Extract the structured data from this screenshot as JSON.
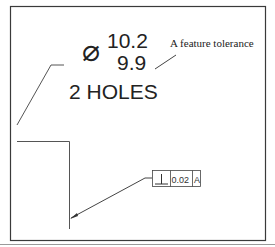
{
  "drawing": {
    "diameter_symbol": "⌀",
    "upper_limit": "10.2",
    "lower_limit": "9.9",
    "hole_count_label": "2 HOLES",
    "annotation": "A feature tolerance",
    "feature_control_frame": {
      "symbol": "⊥",
      "symbol_name": "perpendicularity",
      "tolerance": "0.02",
      "datum": "A"
    }
  },
  "colors": {
    "border": "#3a3a3a",
    "line": "#555555",
    "text": "#222222",
    "bottom_rule": "#9a9a9a"
  }
}
